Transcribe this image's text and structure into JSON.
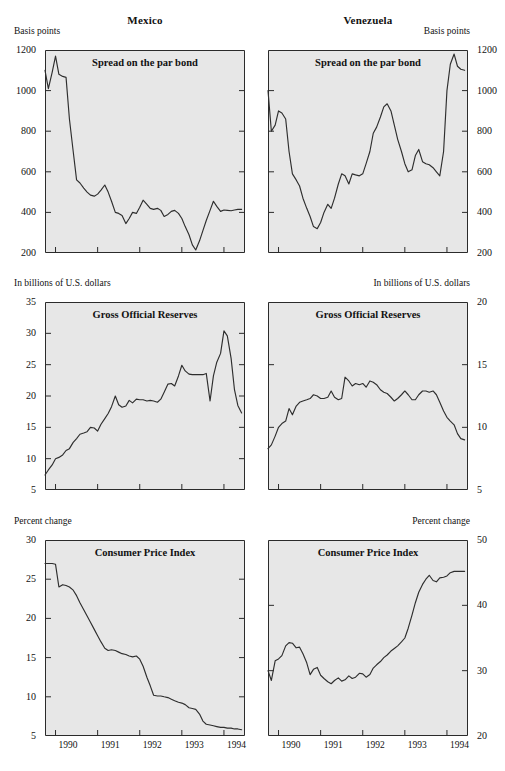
{
  "columns": [
    {
      "key": "mexico",
      "title": "Mexico"
    },
    {
      "key": "venezuela",
      "title": "Venezuela"
    }
  ],
  "chart_data": [
    {
      "id": "mexico-spread",
      "type": "line",
      "country": "Mexico",
      "title": "Spread on the par bond",
      "ylabel": "Basis points",
      "ylabel_side": "left",
      "ylim": [
        200,
        1200
      ],
      "yticks": [
        200,
        400,
        600,
        800,
        1000,
        1200
      ],
      "ytick_labels": [
        "200",
        "400",
        "600",
        "800",
        "1000",
        "1200"
      ],
      "xlim": [
        1989.75,
        1994.5
      ],
      "xticks": [
        1990,
        1991,
        1992,
        1993,
        1994
      ],
      "xtick_labels": [
        "1990",
        "1991",
        "1992",
        "1993",
        "1994"
      ],
      "grid": false,
      "legend": "none",
      "x": [
        1989.75,
        1989.83,
        1989.92,
        1990.0,
        1990.08,
        1990.17,
        1990.25,
        1990.33,
        1990.42,
        1990.5,
        1990.58,
        1990.67,
        1990.75,
        1990.83,
        1990.92,
        1991.0,
        1991.08,
        1991.17,
        1991.25,
        1991.33,
        1991.42,
        1991.5,
        1991.58,
        1991.67,
        1991.75,
        1991.83,
        1991.92,
        1992.0,
        1992.08,
        1992.17,
        1992.25,
        1992.33,
        1992.42,
        1992.5,
        1992.58,
        1992.67,
        1992.75,
        1992.83,
        1992.92,
        1993.0,
        1993.08,
        1993.17,
        1993.25,
        1993.33,
        1993.42,
        1993.5,
        1993.58,
        1993.67,
        1993.75,
        1993.83,
        1993.92,
        1994.0,
        1994.08,
        1994.17,
        1994.25,
        1994.33,
        1994.42
      ],
      "values": [
        1100,
        1010,
        1090,
        1170,
        1080,
        1070,
        1065,
        860,
        700,
        560,
        545,
        520,
        500,
        485,
        480,
        490,
        510,
        535,
        500,
        455,
        400,
        395,
        385,
        345,
        370,
        400,
        395,
        425,
        460,
        440,
        420,
        415,
        420,
        410,
        380,
        390,
        405,
        410,
        395,
        370,
        330,
        290,
        240,
        215,
        260,
        310,
        360,
        410,
        455,
        430,
        405,
        412,
        410,
        408,
        412,
        415,
        415
      ]
    },
    {
      "id": "venezuela-spread",
      "type": "line",
      "country": "Venezuela",
      "title": "Spread on the par bond",
      "ylabel": "Basis points",
      "ylabel_side": "right",
      "ylim": [
        200,
        1200
      ],
      "yticks": [
        200,
        400,
        600,
        800,
        1000,
        1200
      ],
      "ytick_labels": [
        "200",
        "400",
        "600",
        "800",
        "1000",
        "1200"
      ],
      "xlim": [
        1989.75,
        1994.5
      ],
      "xticks": [
        1990,
        1991,
        1992,
        1993,
        1994
      ],
      "xtick_labels": [
        "1990",
        "1991",
        "1992",
        "1993",
        "1994"
      ],
      "grid": false,
      "legend": "none",
      "x": [
        1989.75,
        1989.83,
        1989.92,
        1990.0,
        1990.08,
        1990.17,
        1990.25,
        1990.33,
        1990.42,
        1990.5,
        1990.58,
        1990.67,
        1990.75,
        1990.83,
        1990.92,
        1991.0,
        1991.08,
        1991.17,
        1991.25,
        1991.33,
        1991.42,
        1991.5,
        1991.58,
        1991.67,
        1991.75,
        1991.83,
        1991.92,
        1992.0,
        1992.08,
        1992.17,
        1992.25,
        1992.33,
        1992.42,
        1992.5,
        1992.58,
        1992.67,
        1992.75,
        1992.83,
        1992.92,
        1993.0,
        1993.08,
        1993.17,
        1993.25,
        1993.33,
        1993.42,
        1993.5,
        1993.58,
        1993.67,
        1993.75,
        1993.83,
        1993.92,
        1994.0,
        1994.08,
        1994.17,
        1994.25,
        1994.33,
        1994.42
      ],
      "values": [
        1000,
        800,
        830,
        900,
        890,
        860,
        700,
        590,
        560,
        530,
        470,
        420,
        380,
        330,
        320,
        350,
        400,
        440,
        420,
        470,
        540,
        590,
        580,
        540,
        590,
        585,
        580,
        590,
        640,
        700,
        790,
        820,
        870,
        920,
        935,
        900,
        830,
        760,
        700,
        640,
        600,
        610,
        680,
        710,
        650,
        640,
        635,
        620,
        600,
        580,
        700,
        1000,
        1130,
        1180,
        1120,
        1105,
        1100
      ]
    },
    {
      "id": "mexico-reserves",
      "type": "line",
      "country": "Mexico",
      "title": "Gross Official Reserves",
      "ylabel": "In billions of U.S. dollars",
      "ylabel_side": "left",
      "ylim": [
        5,
        35
      ],
      "yticks": [
        5,
        10,
        15,
        20,
        25,
        30,
        35
      ],
      "ytick_labels": [
        "5",
        "10",
        "15",
        "20",
        "25",
        "30",
        "35"
      ],
      "xlim": [
        1989.75,
        1994.5
      ],
      "xticks": [
        1990,
        1991,
        1992,
        1993,
        1994
      ],
      "xtick_labels": [
        "1990",
        "1991",
        "1992",
        "1993",
        "1994"
      ],
      "grid": false,
      "legend": "none",
      "x": [
        1989.75,
        1989.83,
        1989.92,
        1990.0,
        1990.08,
        1990.17,
        1990.25,
        1990.33,
        1990.42,
        1990.5,
        1990.58,
        1990.67,
        1990.75,
        1990.83,
        1990.92,
        1991.0,
        1991.08,
        1991.17,
        1991.25,
        1991.33,
        1991.42,
        1991.5,
        1991.58,
        1991.67,
        1991.75,
        1991.83,
        1991.92,
        1992.0,
        1992.08,
        1992.17,
        1992.25,
        1992.33,
        1992.42,
        1992.5,
        1992.58,
        1992.67,
        1992.75,
        1992.83,
        1992.92,
        1993.0,
        1993.08,
        1993.17,
        1993.25,
        1993.33,
        1993.42,
        1993.5,
        1993.58,
        1993.67,
        1993.75,
        1993.83,
        1993.92,
        1994.0,
        1994.08,
        1994.17,
        1994.25,
        1994.33,
        1994.42
      ],
      "values": [
        7.4,
        8.2,
        9.0,
        10.0,
        10.2,
        10.6,
        11.3,
        11.6,
        12.6,
        13.2,
        13.9,
        14.1,
        14.3,
        15.0,
        14.9,
        14.4,
        15.5,
        16.4,
        17.2,
        18.3,
        20.0,
        18.6,
        18.2,
        18.4,
        19.3,
        18.9,
        19.5,
        19.4,
        19.4,
        19.2,
        19.3,
        19.2,
        19.0,
        19.5,
        20.6,
        21.9,
        22.0,
        21.6,
        23.2,
        24.9,
        24.0,
        23.5,
        23.4,
        23.4,
        23.4,
        23.4,
        23.6,
        19.2,
        23.2,
        25.4,
        26.8,
        30.4,
        29.6,
        26.0,
        21.0,
        18.5,
        17.3
      ]
    },
    {
      "id": "venezuela-reserves",
      "type": "line",
      "country": "Venezuela",
      "title": "Gross Official Reserves",
      "ylabel": "In billions of U.S. dollars",
      "ylabel_side": "right",
      "ylim": [
        5,
        20
      ],
      "yticks": [
        5,
        10,
        15,
        20
      ],
      "ytick_labels": [
        "5",
        "10",
        "15",
        "20"
      ],
      "xlim": [
        1989.75,
        1994.5
      ],
      "xticks": [
        1990,
        1991,
        1992,
        1993,
        1994
      ],
      "xtick_labels": [
        "1990",
        "1991",
        "1992",
        "1993",
        "1994"
      ],
      "grid": false,
      "legend": "none",
      "x": [
        1989.75,
        1989.83,
        1989.92,
        1990.0,
        1990.08,
        1990.17,
        1990.25,
        1990.33,
        1990.42,
        1990.5,
        1990.58,
        1990.67,
        1990.75,
        1990.83,
        1990.92,
        1991.0,
        1991.08,
        1991.17,
        1991.25,
        1991.33,
        1991.42,
        1991.5,
        1991.58,
        1991.67,
        1991.75,
        1991.83,
        1991.92,
        1992.0,
        1992.08,
        1992.17,
        1992.25,
        1992.33,
        1992.42,
        1992.5,
        1992.58,
        1992.67,
        1992.75,
        1992.83,
        1992.92,
        1993.0,
        1993.08,
        1993.17,
        1993.25,
        1993.33,
        1993.42,
        1993.5,
        1993.58,
        1993.67,
        1993.75,
        1993.83,
        1993.92,
        1994.0,
        1994.08,
        1994.17,
        1994.25,
        1994.33,
        1994.42
      ],
      "values": [
        8.3,
        8.6,
        9.3,
        10.0,
        10.3,
        10.5,
        11.5,
        11.0,
        11.7,
        12.0,
        12.1,
        12.2,
        12.3,
        12.6,
        12.5,
        12.3,
        12.3,
        12.4,
        12.9,
        12.4,
        12.2,
        12.3,
        14.0,
        13.7,
        13.3,
        13.5,
        13.4,
        13.5,
        13.2,
        13.7,
        13.6,
        13.4,
        13.0,
        12.8,
        12.7,
        12.4,
        12.1,
        12.3,
        12.6,
        12.9,
        12.6,
        12.2,
        12.2,
        12.6,
        12.9,
        12.9,
        12.8,
        12.9,
        12.6,
        12.0,
        11.3,
        10.8,
        10.5,
        10.2,
        9.5,
        9.1,
        9.0
      ]
    },
    {
      "id": "mexico-cpi",
      "type": "line",
      "country": "Mexico",
      "title": "Consumer Price Index",
      "ylabel": "Percent change",
      "ylabel_side": "left",
      "ylim": [
        5,
        30
      ],
      "yticks": [
        5,
        10,
        15,
        20,
        25,
        30
      ],
      "ytick_labels": [
        "5",
        "10",
        "15",
        "20",
        "25",
        "30"
      ],
      "xlim": [
        1989.75,
        1994.5
      ],
      "xticks": [
        1990,
        1991,
        1992,
        1993,
        1994
      ],
      "xtick_labels": [
        "1990",
        "1991",
        "1992",
        "1993",
        "1994"
      ],
      "grid": false,
      "legend": "none",
      "x": [
        1989.75,
        1989.83,
        1989.92,
        1990.0,
        1990.08,
        1990.17,
        1990.25,
        1990.33,
        1990.42,
        1990.5,
        1990.58,
        1990.67,
        1990.75,
        1990.83,
        1990.92,
        1991.0,
        1991.08,
        1991.17,
        1991.25,
        1991.33,
        1991.42,
        1991.5,
        1991.58,
        1991.67,
        1991.75,
        1991.83,
        1991.92,
        1992.0,
        1992.08,
        1992.17,
        1992.25,
        1992.33,
        1992.42,
        1992.5,
        1992.58,
        1992.67,
        1992.75,
        1992.83,
        1992.92,
        1993.0,
        1993.08,
        1993.17,
        1993.25,
        1993.33,
        1993.42,
        1993.5,
        1993.58,
        1993.67,
        1993.75,
        1993.83,
        1993.92,
        1994.0,
        1994.08,
        1994.17,
        1994.25,
        1994.33,
        1994.42
      ],
      "values": [
        27.0,
        27.0,
        27.0,
        26.9,
        24.0,
        24.3,
        24.2,
        24.0,
        23.6,
        22.9,
        22.0,
        21.1,
        20.3,
        19.5,
        18.6,
        17.8,
        17.0,
        16.2,
        15.9,
        16.0,
        15.9,
        15.7,
        15.5,
        15.4,
        15.2,
        15.1,
        15.2,
        14.8,
        13.9,
        12.5,
        11.4,
        10.2,
        10.1,
        10.1,
        10.0,
        9.9,
        9.7,
        9.5,
        9.3,
        9.2,
        9.0,
        8.6,
        8.5,
        8.4,
        7.8,
        6.9,
        6.5,
        6.4,
        6.3,
        6.2,
        6.1,
        6.1,
        6.0,
        6.0,
        5.9,
        5.9,
        5.8
      ]
    },
    {
      "id": "venezuela-cpi",
      "type": "line",
      "country": "Venezuela",
      "title": "Consumer Price Index",
      "ylabel": "Percent change",
      "ylabel_side": "right",
      "ylim": [
        20,
        50
      ],
      "yticks": [
        20,
        30,
        40,
        50
      ],
      "ytick_labels": [
        "20",
        "30",
        "40",
        "50"
      ],
      "xlim": [
        1989.75,
        1994.5
      ],
      "xticks": [
        1990,
        1991,
        1992,
        1993,
        1994
      ],
      "xtick_labels": [
        "1990",
        "1991",
        "1992",
        "1993",
        "1994"
      ],
      "grid": false,
      "legend": "none",
      "x": [
        1989.75,
        1989.83,
        1989.92,
        1990.0,
        1990.08,
        1990.17,
        1990.25,
        1990.33,
        1990.42,
        1990.5,
        1990.58,
        1990.67,
        1990.75,
        1990.83,
        1990.92,
        1991.0,
        1991.08,
        1991.17,
        1991.25,
        1991.33,
        1991.42,
        1991.5,
        1991.58,
        1991.67,
        1991.75,
        1991.83,
        1991.92,
        1992.0,
        1992.08,
        1992.17,
        1992.25,
        1992.33,
        1992.42,
        1992.5,
        1992.58,
        1992.67,
        1992.75,
        1992.83,
        1992.92,
        1993.0,
        1993.08,
        1993.17,
        1993.25,
        1993.33,
        1993.42,
        1993.5,
        1993.58,
        1993.67,
        1993.75,
        1993.83,
        1993.92,
        1994.0,
        1994.08,
        1994.17,
        1994.25,
        1994.33,
        1994.42
      ],
      "values": [
        30.0,
        28.5,
        31.5,
        31.8,
        32.3,
        33.8,
        34.3,
        34.2,
        33.5,
        33.6,
        32.6,
        31.2,
        29.4,
        30.2,
        30.5,
        29.3,
        28.8,
        28.3,
        28.0,
        28.5,
        28.9,
        28.4,
        28.6,
        29.2,
        28.8,
        29.0,
        29.6,
        29.5,
        29.0,
        29.4,
        30.4,
        30.9,
        31.4,
        32.0,
        32.4,
        33.0,
        33.4,
        33.8,
        34.4,
        35.0,
        36.5,
        38.5,
        40.4,
        42.0,
        43.2,
        44.0,
        44.6,
        43.8,
        43.6,
        44.2,
        44.3,
        44.5,
        45.0,
        45.2,
        45.2,
        45.2,
        45.2
      ]
    }
  ]
}
